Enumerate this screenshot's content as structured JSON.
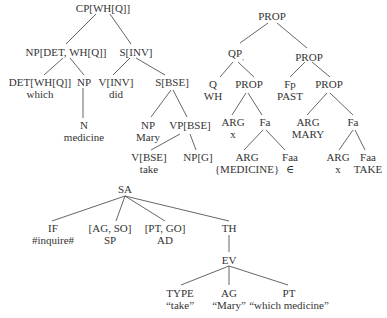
{
  "tree_syntax": {
    "root": "CP[WH[Q]]",
    "np_det_wh": "NP[DET, WH[Q]]",
    "s_inv": "S[INV]",
    "det_wh": "DET[WH[Q]]",
    "det_word": "which",
    "np": "NP",
    "n": "N",
    "n_word": "medicine",
    "v_inv": "V[INV]",
    "v_inv_word": "did",
    "s_bse": "S[BSE]",
    "np_mary": "NP",
    "np_mary_word": "Mary",
    "vp_bse": "VP[BSE]",
    "v_bse": "V[BSE]",
    "v_bse_word": "take",
    "np_g": "NP[G]"
  },
  "tree_semantic": {
    "root": "PROP",
    "qp": "QP",
    "qp_sub": ",",
    "prop_right": "PROP",
    "q": "Q",
    "q_word": "WH",
    "prop_q": "PROP",
    "fp": "Fp",
    "fp_word": "PAST",
    "prop_fp": "PROP",
    "arg_x": "ARG",
    "arg_x_word": "x",
    "fa_left": "Fa",
    "arg_mary": "ARG",
    "arg_mary_word": "MARY",
    "fa_right": "Fa",
    "arg_medicine": "ARG",
    "arg_medicine_word": "{MEDICINE}",
    "faa_left": "Faa",
    "faa_left_word": "∈",
    "arg_x2": "ARG",
    "arg_x2_word": "x",
    "faa_right": "Faa",
    "faa_right_word": "TAKE"
  },
  "tree_speech_act": {
    "root": "SA",
    "if": "IF",
    "if_word": "#inquire#",
    "ag_so": "[AG, SO]",
    "ag_so_word": "SP",
    "pt_go": "[PT, GO]",
    "pt_go_word": "AD",
    "th": "TH",
    "ev": "EV",
    "type": "TYPE",
    "type_word": "“take”",
    "ag": "AG",
    "ag_word": "“Mary”",
    "pt": "PT",
    "pt_word": "“which medicine”"
  }
}
